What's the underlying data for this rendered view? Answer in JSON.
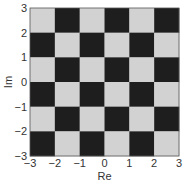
{
  "chart_data": {
    "type": "heatmap",
    "title": "",
    "xlabel": "Re",
    "ylabel": "Im",
    "xlim": [
      -3,
      3
    ],
    "ylim": [
      -3,
      3
    ],
    "xticks": [
      "−3",
      "−2",
      "−1",
      "0",
      "1",
      "2",
      "3"
    ],
    "yticks": [
      "−3",
      "−2",
      "−1",
      "0",
      "1",
      "2",
      "3"
    ],
    "xtick_values": [
      -3,
      -2,
      -1,
      0,
      1,
      2,
      3
    ],
    "ytick_values": [
      -3,
      -2,
      -1,
      0,
      1,
      2,
      3
    ],
    "grid": false,
    "cell_size": 1,
    "rows_top_to_bottom": [
      [
        0,
        1,
        0,
        1,
        0,
        1
      ],
      [
        1,
        0,
        1,
        0,
        1,
        0
      ],
      [
        0,
        1,
        0,
        1,
        0,
        1
      ],
      [
        1,
        0,
        1,
        0,
        1,
        0
      ],
      [
        0,
        1,
        0,
        1,
        0,
        1
      ],
      [
        1,
        0,
        1,
        0,
        1,
        0
      ]
    ],
    "colors": {
      "dark": "#1e1e1e",
      "light": "#d2d2d2",
      "axis": "#555555"
    }
  }
}
